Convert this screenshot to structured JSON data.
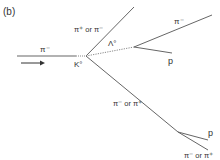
{
  "panel_label": "(b)",
  "labels": {
    "beam": "π⁻",
    "k0": "K°",
    "upper_track": "π⁺ or π⁻",
    "lambda": "Λ°",
    "lambda_pi": "π⁻",
    "lambda_p": "p",
    "lower_track": "π⁻ or π⁺",
    "lower_p": "p",
    "lower_pi": "π⁻ or π⁺"
  },
  "colors": {
    "track": "#555555",
    "text": "#333333"
  }
}
